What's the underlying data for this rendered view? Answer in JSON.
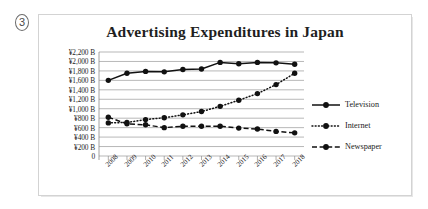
{
  "figure_marker": "3",
  "chart_data": {
    "type": "line",
    "title": "Advertising Expenditures in Japan",
    "xlabel": "",
    "ylabel": "",
    "categories": [
      "2008",
      "2009",
      "2010",
      "2011",
      "2012",
      "2013",
      "2014",
      "2015",
      "2016",
      "2017",
      "2018"
    ],
    "ytick_labels": [
      "¥2,200 B",
      "¥2,000 B",
      "¥1,800 B",
      "¥1,600 B",
      "¥1,400 B",
      "¥1,200 B",
      "¥1,000 B",
      "¥800 B",
      "¥600 B",
      "¥400 B",
      "¥200 B",
      "0"
    ],
    "ytick_values": [
      2200,
      2000,
      1800,
      1600,
      1400,
      1200,
      1000,
      800,
      600,
      400,
      200,
      0
    ],
    "ylim": [
      0,
      2200
    ],
    "yunit": "Billion yen",
    "grid": true,
    "legend_position": "right",
    "series": [
      {
        "name": "Television",
        "style": "solid",
        "marker": "circle",
        "color": "#111111",
        "values": [
          1600,
          1750,
          1790,
          1780,
          1830,
          1840,
          1980,
          1950,
          1980,
          1970,
          1940
        ]
      },
      {
        "name": "Internet",
        "style": "dotted",
        "marker": "circle",
        "color": "#111111",
        "values": [
          700,
          710,
          770,
          810,
          870,
          940,
          1050,
          1180,
          1320,
          1510,
          1750
        ]
      },
      {
        "name": "Newspaper",
        "style": "dashed",
        "marker": "circle",
        "color": "#111111",
        "values": [
          820,
          680,
          660,
          600,
          630,
          630,
          630,
          590,
          570,
          520,
          490
        ]
      }
    ]
  }
}
